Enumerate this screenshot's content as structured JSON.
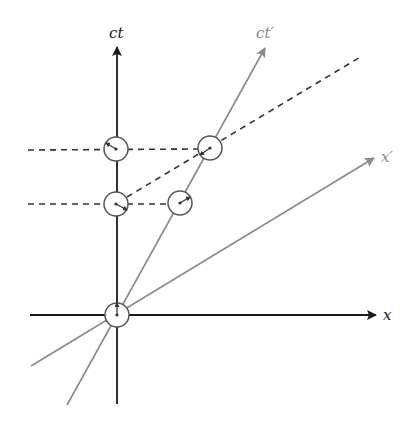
{
  "diagram": {
    "labels": {
      "ct": "ct",
      "ct_prime": "ct′",
      "x": "x",
      "x_prime": "x′"
    },
    "colors": {
      "axis": "#1a1a1a",
      "primed_axis": "#8a8a8a",
      "dashed": "#333333",
      "circle": "#555555",
      "background": "#ffffff"
    },
    "origin": [
      117,
      315
    ],
    "axes": {
      "ct": {
        "from": [
          117,
          404
        ],
        "to": [
          117,
          47
        ]
      },
      "x": {
        "from": [
          30,
          315
        ],
        "to": [
          376,
          315
        ]
      },
      "ct_prime": {
        "from": [
          67,
          405
        ],
        "to": [
          265,
          48
        ]
      },
      "x_prime": {
        "from": [
          31,
          366
        ],
        "to": [
          374,
          158
        ]
      }
    },
    "dashed_lines": [
      {
        "from": [
          28,
          150
        ],
        "to": [
          198,
          149
        ]
      },
      {
        "from": [
          28,
          204
        ],
        "to": [
          168,
          204
        ]
      },
      {
        "from": [
          127,
          197
        ],
        "to": [
          362,
          56
        ]
      }
    ],
    "clocks": [
      {
        "center": [
          117,
          315
        ],
        "r": 12,
        "hand": [
          117,
          303
        ]
      },
      {
        "center": [
          116,
          149
        ],
        "r": 12,
        "hand": [
          106,
          143
        ]
      },
      {
        "center": [
          210,
          148
        ],
        "r": 12,
        "hand": [
          200,
          155
        ]
      },
      {
        "center": [
          116,
          204
        ],
        "r": 12,
        "hand": [
          127,
          210
        ]
      },
      {
        "center": [
          180,
          203
        ],
        "r": 12,
        "hand": [
          190,
          197
        ]
      }
    ]
  }
}
